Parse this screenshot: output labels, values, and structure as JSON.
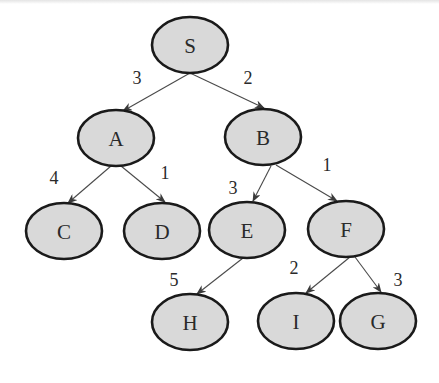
{
  "diagram": {
    "type": "weighted-tree",
    "colors": {
      "node_fill": "#d9d9d9",
      "node_stroke": "#1a1a1a",
      "edge": "#4a4a4a",
      "text": "#2a2a2a"
    },
    "nodes": [
      {
        "id": "S",
        "label": "S",
        "cx": 190,
        "cy": 45,
        "rx": 38,
        "ry": 28
      },
      {
        "id": "A",
        "label": "A",
        "cx": 116,
        "cy": 138,
        "rx": 38,
        "ry": 28
      },
      {
        "id": "B",
        "label": "B",
        "cx": 263,
        "cy": 137,
        "rx": 38,
        "ry": 28
      },
      {
        "id": "C",
        "label": "C",
        "cx": 64,
        "cy": 231,
        "rx": 38,
        "ry": 28
      },
      {
        "id": "D",
        "label": "D",
        "cx": 162,
        "cy": 231,
        "rx": 38,
        "ry": 28
      },
      {
        "id": "E",
        "label": "E",
        "cx": 247,
        "cy": 230,
        "rx": 38,
        "ry": 28
      },
      {
        "id": "F",
        "label": "F",
        "cx": 346,
        "cy": 229,
        "rx": 38,
        "ry": 28
      },
      {
        "id": "H",
        "label": "H",
        "cx": 190,
        "cy": 322,
        "rx": 38,
        "ry": 28
      },
      {
        "id": "I",
        "label": "I",
        "cx": 296,
        "cy": 321,
        "rx": 38,
        "ry": 28
      },
      {
        "id": "G",
        "label": "G",
        "cx": 378,
        "cy": 321,
        "rx": 38,
        "ry": 28
      }
    ],
    "edges": [
      {
        "from": "S",
        "to": "A",
        "weight": "3",
        "x1": 190,
        "y1": 73,
        "x2": 123,
        "y2": 111,
        "lx": 137,
        "ly": 78
      },
      {
        "from": "S",
        "to": "B",
        "weight": "2",
        "x1": 190,
        "y1": 73,
        "x2": 264,
        "y2": 108,
        "lx": 248,
        "ly": 78
      },
      {
        "from": "A",
        "to": "C",
        "weight": "4",
        "x1": 111,
        "y1": 166,
        "x2": 68,
        "y2": 203,
        "lx": 54,
        "ly": 178
      },
      {
        "from": "A",
        "to": "D",
        "weight": "1",
        "x1": 121,
        "y1": 166,
        "x2": 165,
        "y2": 202,
        "lx": 165,
        "ly": 173
      },
      {
        "from": "B",
        "to": "E",
        "weight": "3",
        "x1": 271,
        "y1": 166,
        "x2": 253,
        "y2": 201,
        "lx": 233,
        "ly": 188
      },
      {
        "from": "B",
        "to": "F",
        "weight": "1",
        "x1": 276,
        "y1": 165,
        "x2": 337,
        "y2": 201,
        "lx": 327,
        "ly": 165
      },
      {
        "from": "E",
        "to": "H",
        "weight": "5",
        "x1": 243,
        "y1": 258,
        "x2": 197,
        "y2": 294,
        "lx": 174,
        "ly": 280
      },
      {
        "from": "F",
        "to": "I",
        "weight": "2",
        "x1": 350,
        "y1": 257,
        "x2": 306,
        "y2": 293,
        "lx": 294,
        "ly": 268
      },
      {
        "from": "F",
        "to": "G",
        "weight": "3",
        "x1": 355,
        "y1": 257,
        "x2": 381,
        "y2": 292,
        "lx": 398,
        "ly": 280
      }
    ]
  }
}
